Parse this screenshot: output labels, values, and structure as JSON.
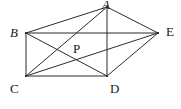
{
  "figure": {
    "width": 181,
    "height": 109,
    "background_color": "#ffffff",
    "line_color": "#2b2b2b",
    "label_color": "#1a1a1a",
    "stroke_width": 1
  },
  "points": [
    {
      "id": "A",
      "label": "A",
      "x": 107,
      "y": 7,
      "label_x": 102,
      "label_y": -2,
      "italic": true,
      "style": "vertex"
    },
    {
      "id": "B",
      "label": "B",
      "x": 26,
      "y": 33,
      "label_x": 10,
      "label_y": 26,
      "italic": true,
      "style": "vertex"
    },
    {
      "id": "E",
      "label": "E",
      "x": 158,
      "y": 33,
      "label_x": 166,
      "label_y": 25,
      "italic": false,
      "style": "vertex"
    },
    {
      "id": "P",
      "label": "P",
      "x": 72,
      "y": 53,
      "label_x": 73,
      "label_y": 42,
      "italic": false,
      "style": "interior"
    },
    {
      "id": "C",
      "label": "C",
      "x": 26,
      "y": 76,
      "label_x": 10,
      "label_y": 82,
      "italic": false,
      "style": "vertex"
    },
    {
      "id": "D",
      "label": "D",
      "x": 107,
      "y": 76,
      "label_x": 110,
      "label_y": 82,
      "italic": false,
      "style": "vertex"
    }
  ],
  "segments": [
    {
      "name": "segment-A-B",
      "from": "A",
      "to": "B"
    },
    {
      "name": "segment-A-E",
      "from": "A",
      "to": "E"
    },
    {
      "name": "segment-A-C",
      "from": "A",
      "to": "C"
    },
    {
      "name": "segment-A-D",
      "from": "A",
      "to": "D"
    },
    {
      "name": "segment-B-E",
      "from": "B",
      "to": "E"
    },
    {
      "name": "segment-B-C",
      "from": "B",
      "to": "C"
    },
    {
      "name": "segment-B-D",
      "from": "B",
      "to": "D"
    },
    {
      "name": "segment-C-D",
      "from": "C",
      "to": "D"
    },
    {
      "name": "segment-C-E",
      "from": "C",
      "to": "E"
    },
    {
      "name": "segment-D-E",
      "from": "D",
      "to": "E"
    }
  ]
}
